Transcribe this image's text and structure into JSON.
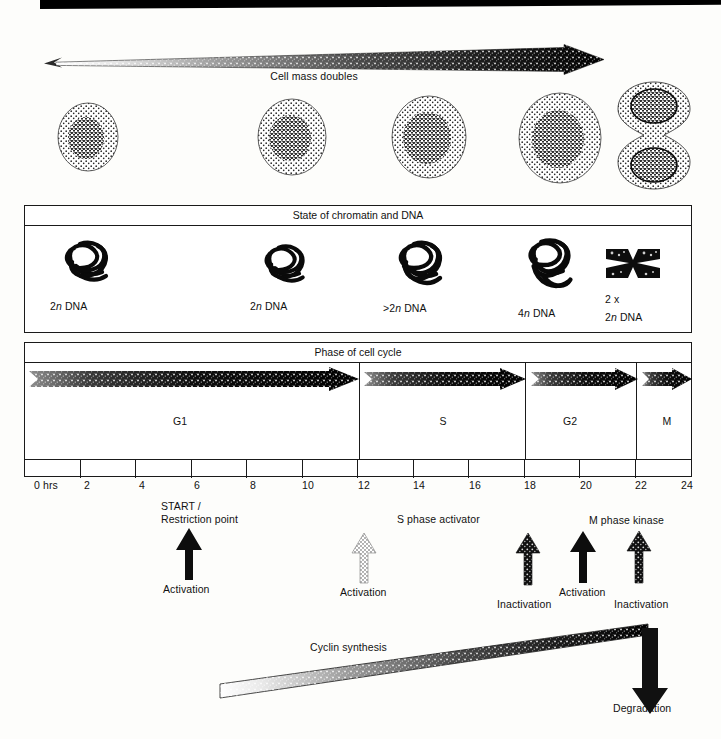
{
  "figure": {
    "top_arrow_label": "Cell mass doubles",
    "chromatin_panel_title": "State of chromatin and DNA",
    "phase_panel_title": "Phase of cell cycle"
  },
  "cells": [
    {
      "name": "cell-1-g1-early",
      "stage": "G1 early"
    },
    {
      "name": "cell-2-g1-late",
      "stage": "G1 late"
    },
    {
      "name": "cell-3-s",
      "stage": "S"
    },
    {
      "name": "cell-4-g2",
      "stage": "G2"
    },
    {
      "name": "cell-5-mitosis",
      "stage": "M dividing"
    }
  ],
  "chromatin_states": [
    {
      "label_prefix": "2",
      "label_italic": "n",
      "label_suffix": " DNA",
      "text": "2n DNA",
      "form": "tangled-chromatin"
    },
    {
      "label_prefix": "2",
      "label_italic": "n",
      "label_suffix": " DNA",
      "text": "2n DNA",
      "form": "tangled-chromatin"
    },
    {
      "label_prefix": ">2",
      "label_italic": "n",
      "label_suffix": " DNA",
      "text": ">2n DNA",
      "form": "tangled-chromatin"
    },
    {
      "label_prefix": "4",
      "label_italic": "n",
      "label_suffix": " DNA",
      "text": "4n DNA",
      "form": "tangled-chromatin"
    },
    {
      "label_prefix": "2 x",
      "label_italic": "n",
      "label_suffix": " DNA",
      "text_line1": "2 x",
      "text_line2": "2n DNA",
      "form": "condensed-chromosome"
    }
  ],
  "phases": [
    {
      "label": "G1",
      "start_hr": 0,
      "end_hr": 12
    },
    {
      "label": "S",
      "start_hr": 12,
      "end_hr": 18
    },
    {
      "label": "G2",
      "start_hr": 18,
      "end_hr": 22
    },
    {
      "label": "M",
      "start_hr": 22,
      "end_hr": 24
    }
  ],
  "time_axis": {
    "unit_label": "0 hrs",
    "ticks": [
      "0 hrs",
      "2",
      "4",
      "6",
      "8",
      "10",
      "12",
      "14",
      "16",
      "18",
      "20",
      "22",
      "24"
    ],
    "min_hr": 0,
    "max_hr": 24,
    "step_hr": 2
  },
  "regulators": [
    {
      "name": "start-restriction-point",
      "title_line1": "START /",
      "title_line2": "Restriction point",
      "action": "Activation",
      "arrow_style": "solid-black",
      "hour": 6
    },
    {
      "name": "s-phase-activator",
      "title_line1": "S phase activator",
      "title_line2": "",
      "action": "Activation",
      "arrow_style": "light-stipple",
      "hour": 12
    },
    {
      "name": "s-phase-activator-inactivation",
      "title_line1": "",
      "title_line2": "",
      "action": "Inactivation",
      "arrow_style": "dark-stipple",
      "hour": 18
    },
    {
      "name": "m-phase-kinase-activation",
      "title_line1": "M phase kinase",
      "title_line2": "",
      "action": "Activation",
      "arrow_style": "solid-black",
      "hour": 20
    },
    {
      "name": "m-phase-kinase-inactivation",
      "title_line1": "",
      "title_line2": "",
      "action": "Inactivation",
      "arrow_style": "dark-stipple",
      "hour": 22
    }
  ],
  "cyclin": {
    "synthesis_label": "Cyclin synthesis",
    "degradation_label": "Degradation"
  },
  "colors": {
    "ink": "#111111",
    "line": "#1a1a1a",
    "paper": "#fdfdfb",
    "cell_fill": "#d9d9d9",
    "nucleus_fill": "#8f8f8f",
    "gradient_light": "#f2f2f2",
    "gradient_dark": "#000000"
  }
}
